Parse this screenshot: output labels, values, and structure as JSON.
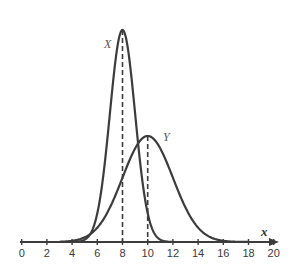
{
  "chart_data": {
    "type": "line",
    "title": "",
    "xlabel": "x",
    "ylabel": "",
    "xlim": [
      0,
      20
    ],
    "x_ticks": [
      0,
      2,
      4,
      6,
      8,
      10,
      12,
      14,
      16,
      18,
      20
    ],
    "grid": false,
    "legend": "none (curves labeled inline)",
    "series": [
      {
        "name": "X",
        "distribution": "normal",
        "mean": 8,
        "std": 1,
        "label_position": "left of peak",
        "peak_marker": "dashed vertical line at x=8"
      },
      {
        "name": "Y",
        "distribution": "normal",
        "mean": 10,
        "std": 2,
        "label_position": "right of peak",
        "peak_marker": "dashed vertical line at x=10"
      }
    ],
    "annotations": [
      {
        "text": "X",
        "near": "peak of X curve"
      },
      {
        "text": "Y",
        "near": "peak of Y curve"
      },
      {
        "text": "x",
        "near": "right end of horizontal axis"
      }
    ]
  },
  "labels": {
    "x_axis": "x",
    "curve_x": "X",
    "curve_y": "Y",
    "ticks": [
      "0",
      "2",
      "4",
      "6",
      "8",
      "10",
      "12",
      "14",
      "16",
      "18",
      "20"
    ]
  },
  "colors": {
    "curve": "#3c3c3c",
    "axis": "#3c3c3c",
    "background": "#ffffff"
  }
}
